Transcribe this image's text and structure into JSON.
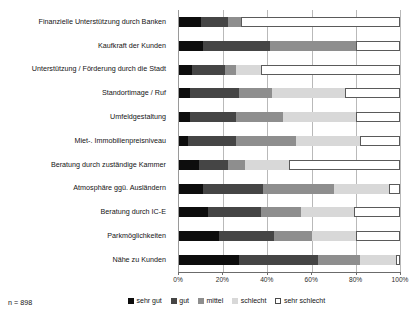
{
  "chart_data": {
    "type": "bar",
    "title": "",
    "subtitle": "",
    "xlabel": "",
    "ylabel": "",
    "orientation": "horizontal",
    "stacked": true,
    "normalized": "percent",
    "xlim": [
      0,
      100
    ],
    "grid": true,
    "legend_position": "bottom",
    "sample_size_label": "n = 898",
    "categories": [
      "Finanzielle Unterstützung durch Banken",
      "Kaufkraft der Kunden",
      "Unterstützung / Förderung durch die Stadt",
      "Standortimage / Ruf",
      "Umfeldgestaltung",
      "Miet-. Immobilienpreisniveau",
      "Beratung durch zuständige Kammer",
      "Atmosphäre ggü. Ausländern",
      "Beratung durch IC-E",
      "Parkmöglichkeiten",
      "Nähe zu Kunden"
    ],
    "series": [
      {
        "name": "sehr gut",
        "color": "#0d0d0d",
        "values": [
          10,
          11,
          6,
          5,
          5,
          4,
          9,
          11,
          13,
          18,
          27
        ]
      },
      {
        "name": "gut",
        "color": "#454545",
        "values": [
          12,
          30,
          15,
          22,
          21,
          22,
          13,
          27,
          24,
          25,
          36
        ]
      },
      {
        "name": "mittel",
        "color": "#8e8e8e",
        "values": [
          6,
          39,
          5,
          15,
          21,
          27,
          8,
          32,
          18,
          17,
          19
        ]
      },
      {
        "name": "schlecht",
        "color": "#d8d8d8",
        "values": [
          0,
          0,
          11,
          33,
          33,
          29,
          20,
          25,
          24,
          20,
          16
        ]
      },
      {
        "name": "sehr schlecht",
        "color": "#ffffff",
        "values": [
          72,
          20,
          63,
          25,
          20,
          18,
          50,
          5,
          21,
          20,
          2
        ]
      }
    ],
    "xticks": [
      {
        "value": 0,
        "label": "0%"
      },
      {
        "value": 20,
        "label": "20%"
      },
      {
        "value": 40,
        "label": "40%"
      },
      {
        "value": 60,
        "label": "60%"
      },
      {
        "value": 80,
        "label": "80%"
      },
      {
        "value": 100,
        "label": "100%"
      }
    ]
  }
}
